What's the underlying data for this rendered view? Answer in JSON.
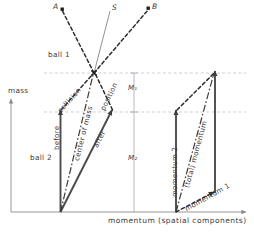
{
  "diagram": {
    "axes": {
      "y_label": "mass",
      "x_label": "momentum (spatial components)"
    },
    "point_labels": {
      "a": "A",
      "s": "S",
      "b": "B"
    },
    "region_labels": {
      "ball1": "ball 1",
      "ball2": "ball 2"
    },
    "mass_segments": {
      "m1": "M₁",
      "m2": "M₂"
    },
    "left_vectors": {
      "before": "before",
      "after": "after",
      "center_of_mass": "center of mass",
      "collision": "collision",
      "position": "position"
    },
    "right_vectors": {
      "momentum1": "momentum 1",
      "momentum2": "momentum 2",
      "total": "(total) momentum"
    },
    "colors": {
      "ink": "#3a3a3a",
      "solid_vector": "#4a4a4a",
      "dashed": "#2e2e2e",
      "guide": "#b8b8c8",
      "axis": "#8a8a8a"
    }
  }
}
